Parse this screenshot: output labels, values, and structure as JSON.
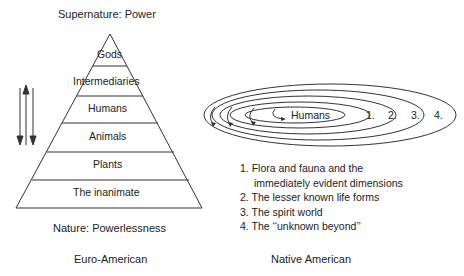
{
  "left": {
    "top_label": "Supernature: Power",
    "bottom_label": "Nature: Powerlessness",
    "caption": "Euro-American",
    "tiers": [
      "Gods",
      "Intermediaries",
      "Humans",
      "Animals",
      "Plants",
      "The inanimate"
    ]
  },
  "right": {
    "center_label": "Humans",
    "ring_labels": [
      "1.",
      "2.",
      "3.",
      "4."
    ],
    "legend": [
      {
        "num": "1.",
        "text": "Flora and fauna and the",
        "cont": "immediately evident dimensions"
      },
      {
        "num": "2.",
        "text": "The lesser known life forms"
      },
      {
        "num": "3.",
        "text": "The spirit world"
      },
      {
        "num": "4.",
        "text": "The ‘‘unknown beyond’’"
      }
    ],
    "caption": "Native American"
  }
}
